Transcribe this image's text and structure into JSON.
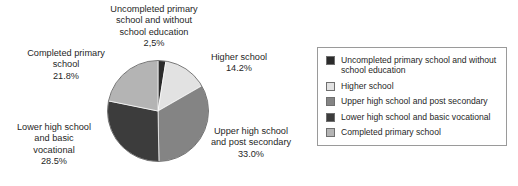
{
  "chart_data": {
    "type": "pie",
    "title": "",
    "subtitle": "",
    "xlabel": "",
    "ylabel": "",
    "legend_position": "right",
    "grid": false,
    "categories": [
      "Uncompleted primary school and without school education",
      "Higher school",
      "Upper high school and post secondary",
      "Lower high school and basic vocational",
      "Completed primary school"
    ],
    "values": [
      2.5,
      14.2,
      33.0,
      28.5,
      21.8
    ],
    "value_labels": [
      "2,5%",
      "14.2%",
      "33.0%",
      "28.5%",
      "21.8%"
    ],
    "colors": [
      "#2b2b2b",
      "#e2e2e2",
      "#848484",
      "#3c3c3c",
      "#b4b4b4"
    ],
    "start_angle_deg": 0,
    "direction": "clockwise",
    "slices": [
      {
        "name": "Uncompleted primary school and without school education",
        "value": 2.5,
        "value_label": "2,5%",
        "color": "#2b2b2b",
        "label_lines": [
          "Uncompleted primary",
          "school and without",
          "school education"
        ]
      },
      {
        "name": "Higher school",
        "value": 14.2,
        "value_label": "14.2%",
        "color": "#e2e2e2",
        "label_lines": [
          "Higher school"
        ]
      },
      {
        "name": "Upper high school and post secondary",
        "value": 33.0,
        "value_label": "33.0%",
        "color": "#848484",
        "label_lines": [
          "Upper high school",
          "and post secondary"
        ]
      },
      {
        "name": "Lower high school and basic vocational",
        "value": 28.5,
        "value_label": "28.5%",
        "color": "#3c3c3c",
        "label_lines": [
          "Lower high school",
          "and basic",
          "vocational"
        ]
      },
      {
        "name": "Completed primary school",
        "value": 21.8,
        "value_label": "21.8%",
        "color": "#b4b4b4",
        "label_lines": [
          "Completed primary",
          "school"
        ]
      }
    ]
  },
  "labels": {
    "uncompleted": {
      "line1": "Uncompleted primary",
      "line2": "school and without",
      "line3": "school education",
      "pct": "2,5%"
    },
    "completed": {
      "line1": "Completed primary",
      "line2": "school",
      "pct": "21.8%"
    },
    "lower": {
      "line1": "Lower high school",
      "line2": "and basic",
      "line3": "vocational",
      "pct": "28.5%"
    },
    "higher": {
      "line1": "Higher school",
      "pct": "14.2%"
    },
    "upper": {
      "line1": "Upper high school",
      "line2": "and post secondary",
      "pct": "33.0%"
    }
  },
  "legend": {
    "items": [
      {
        "label": "Uncompleted primary school and without school education",
        "color": "#2b2b2b"
      },
      {
        "label": "Higher school",
        "color": "#e2e2e2"
      },
      {
        "label": "Upper high school and post secondary",
        "color": "#848484"
      },
      {
        "label": "Lower high school and basic vocational",
        "color": "#3c3c3c"
      },
      {
        "label": "Completed primary school",
        "color": "#b4b4b4"
      }
    ]
  }
}
